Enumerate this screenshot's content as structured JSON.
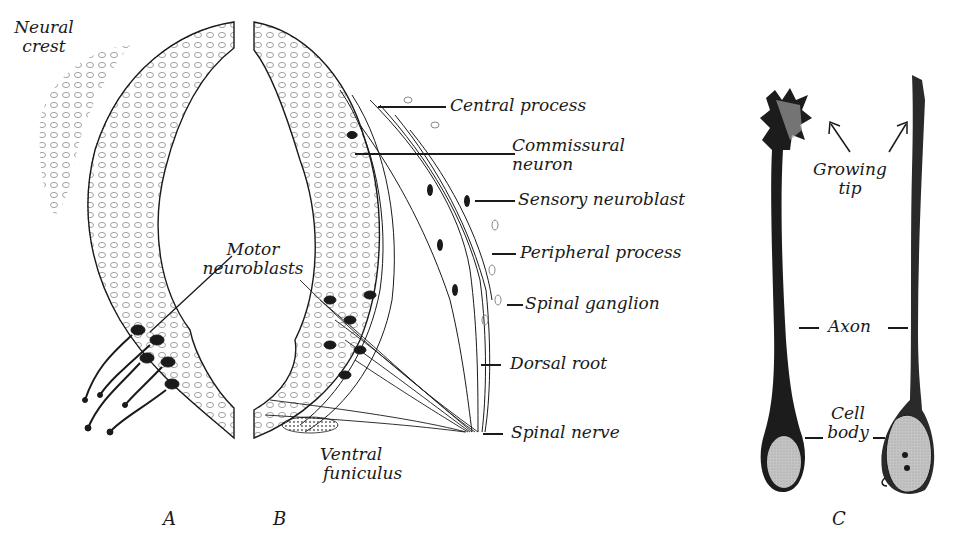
{
  "figure": {
    "panels": [
      {
        "id": "A",
        "label": "A"
      },
      {
        "id": "B",
        "label": "B"
      },
      {
        "id": "C",
        "label": "C"
      }
    ],
    "panel_a": {
      "labels": {
        "neural_crest_line1": "Neural",
        "neural_crest_line2": "crest",
        "motor_line1": "Motor",
        "motor_line2": "neuroblasts"
      }
    },
    "panel_b": {
      "labels": {
        "central_process": "Central process",
        "commissural_line1": "Commissural",
        "commissural_line2": "neuron",
        "sensory_neuroblast": "Sensory neuroblast",
        "peripheral_process": "Peripheral process",
        "spinal_ganglion": "Spinal ganglion",
        "dorsal_root": "Dorsal root",
        "spinal_nerve": "Spinal nerve",
        "ventral_line1": "Ventral",
        "ventral_line2": "funiculus"
      }
    },
    "panel_c": {
      "labels": {
        "growing_line1": "Growing",
        "growing_line2": "tip",
        "axon": "Axon",
        "cell_line1": "Cell",
        "cell_line2": "body"
      }
    },
    "colors": {
      "ink": "#1a1a1a",
      "stipple": "#8a8a8a",
      "cell_body_fill": "#c9c9c9",
      "background": "#ffffff"
    }
  }
}
